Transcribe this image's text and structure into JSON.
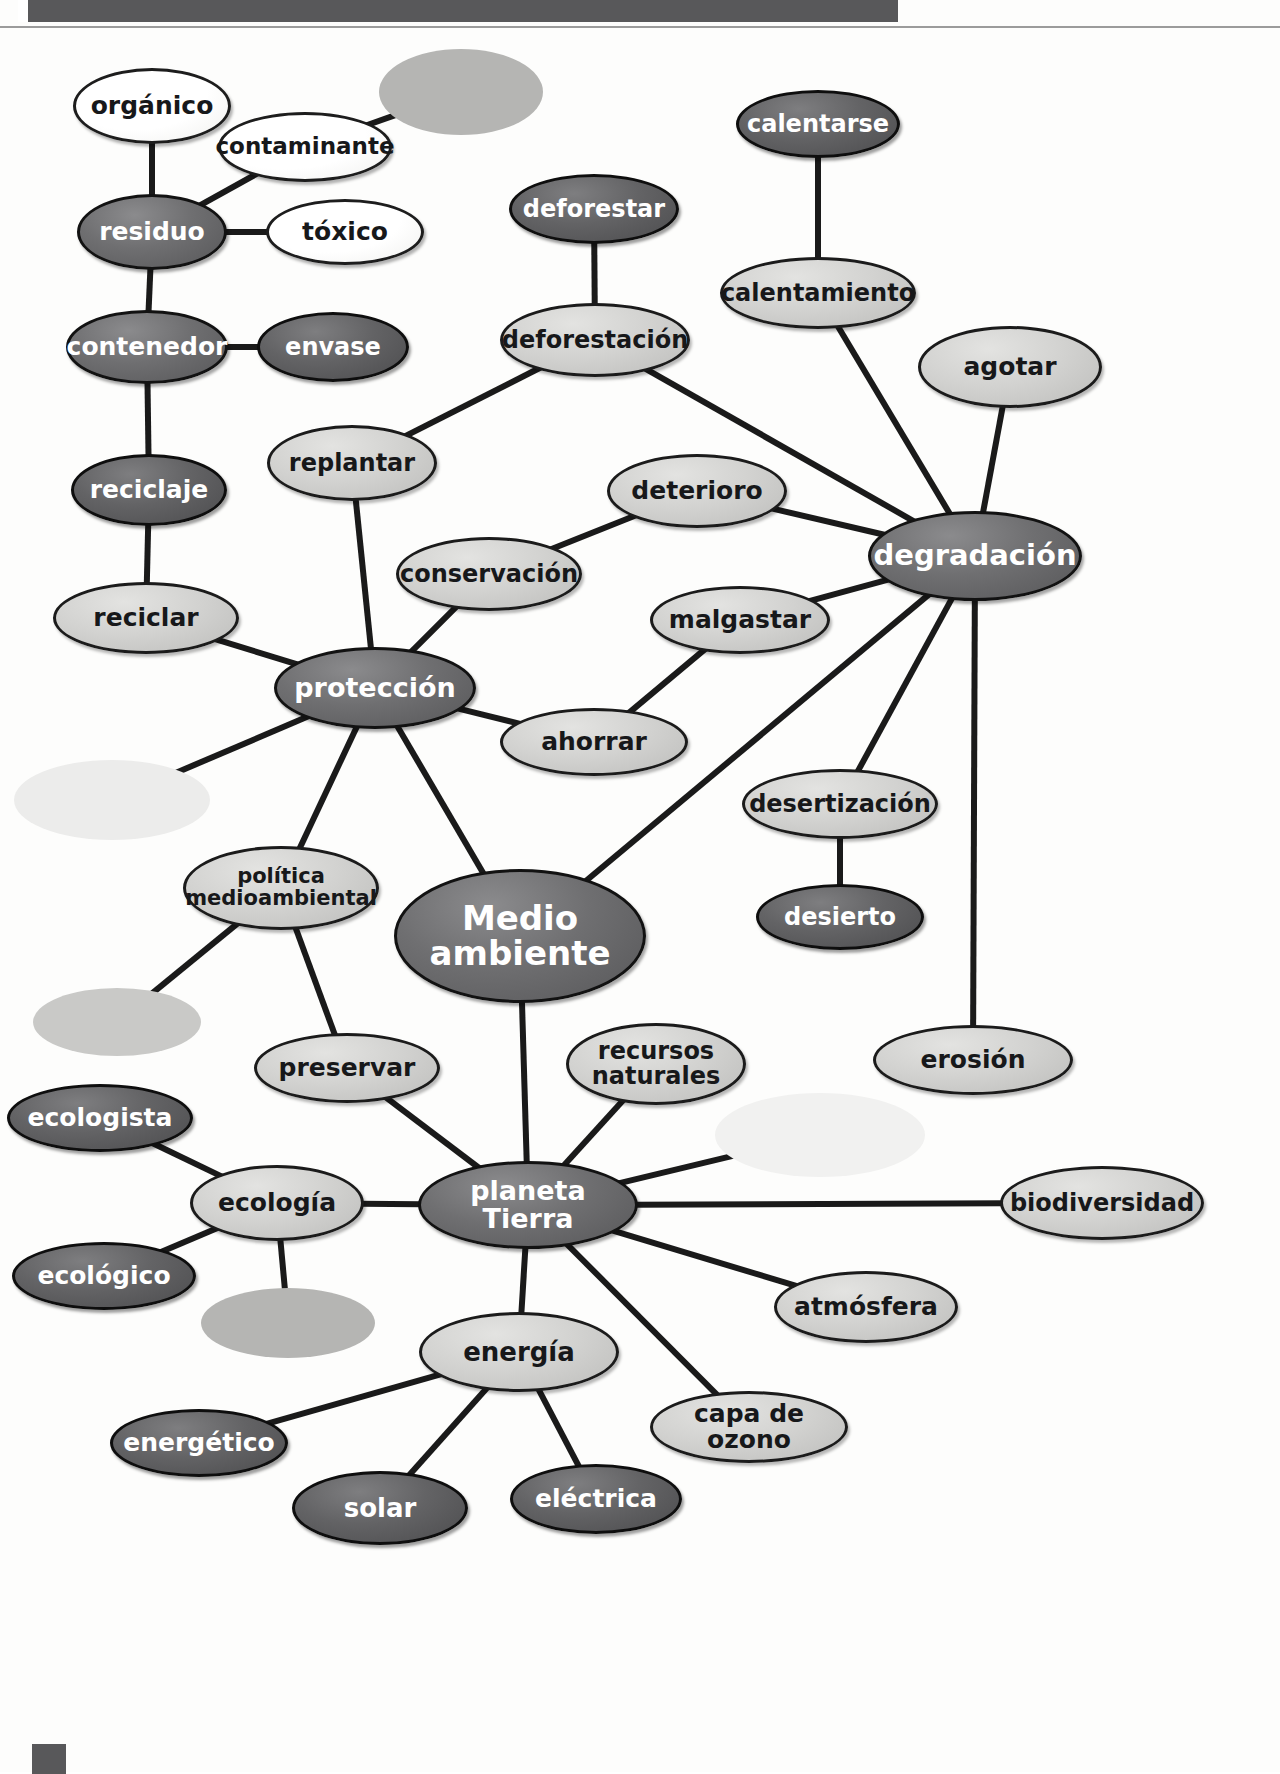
{
  "page": {
    "title": "Medio ambiente",
    "language": "es",
    "header_bar_color": "#58585a",
    "background_color": "#fdfdfc"
  },
  "chart_data": {
    "type": "diagram",
    "subtype": "mind-map",
    "title": "Medio ambiente",
    "center": "Medio ambiente",
    "nodes": [
      {
        "id": "organico",
        "label": "orgánico",
        "tone": "white",
        "cx": 152,
        "cy": 106,
        "rx": 79,
        "ry": 38,
        "font": 25
      },
      {
        "id": "contaminante",
        "label": "contaminante",
        "tone": "white",
        "cx": 305,
        "cy": 147,
        "rx": 87,
        "ry": 35,
        "font": 23
      },
      {
        "id": "blank-top",
        "label": "",
        "tone": "blank-mid",
        "cx": 461,
        "cy": 92,
        "rx": 82,
        "ry": 43,
        "font": 20
      },
      {
        "id": "residuo",
        "label": "residuo",
        "tone": "dark",
        "cx": 152,
        "cy": 232,
        "rx": 75,
        "ry": 38,
        "font": 25
      },
      {
        "id": "toxico",
        "label": "tóxico",
        "tone": "white",
        "cx": 345,
        "cy": 232,
        "rx": 79,
        "ry": 33,
        "font": 25
      },
      {
        "id": "contenedor",
        "label": "contenedor",
        "tone": "dark",
        "cx": 147,
        "cy": 347,
        "rx": 81,
        "ry": 37,
        "font": 25
      },
      {
        "id": "envase",
        "label": "envase",
        "tone": "darker",
        "cx": 333,
        "cy": 347,
        "rx": 76,
        "ry": 35,
        "font": 24
      },
      {
        "id": "reciclaje",
        "label": "reciclaje",
        "tone": "darker",
        "cx": 149,
        "cy": 490,
        "rx": 78,
        "ry": 36,
        "font": 25
      },
      {
        "id": "reciclar",
        "label": "reciclar",
        "tone": "light",
        "cx": 146,
        "cy": 618,
        "rx": 93,
        "ry": 36,
        "font": 25
      },
      {
        "id": "deforestar",
        "label": "deforestar",
        "tone": "darker",
        "cx": 594,
        "cy": 209,
        "rx": 85,
        "ry": 35,
        "font": 24
      },
      {
        "id": "deforestacion",
        "label": "deforestación",
        "tone": "light",
        "cx": 595,
        "cy": 340,
        "rx": 95,
        "ry": 37,
        "font": 24
      },
      {
        "id": "calentarse",
        "label": "calentarse",
        "tone": "darker",
        "cx": 818,
        "cy": 124,
        "rx": 82,
        "ry": 34,
        "font": 24
      },
      {
        "id": "calentamiento",
        "label": "calentamiento",
        "tone": "light",
        "cx": 818,
        "cy": 293,
        "rx": 98,
        "ry": 36,
        "font": 24
      },
      {
        "id": "agotar",
        "label": "agotar",
        "tone": "light",
        "cx": 1010,
        "cy": 367,
        "rx": 92,
        "ry": 41,
        "font": 25
      },
      {
        "id": "replantar",
        "label": "replantar",
        "tone": "light",
        "cx": 352,
        "cy": 463,
        "rx": 85,
        "ry": 38,
        "font": 24
      },
      {
        "id": "deterioro",
        "label": "deterioro",
        "tone": "light",
        "cx": 697,
        "cy": 491,
        "rx": 90,
        "ry": 37,
        "font": 25
      },
      {
        "id": "conservacion",
        "label": "conservación",
        "tone": "light",
        "cx": 489,
        "cy": 574,
        "rx": 93,
        "ry": 37,
        "font": 24
      },
      {
        "id": "degradacion",
        "label": "degradación",
        "tone": "dark",
        "cx": 975,
        "cy": 556,
        "rx": 107,
        "ry": 45,
        "font": 29
      },
      {
        "id": "malgastar",
        "label": "malgastar",
        "tone": "light",
        "cx": 740,
        "cy": 620,
        "rx": 90,
        "ry": 34,
        "font": 25
      },
      {
        "id": "proteccion",
        "label": "protección",
        "tone": "dark",
        "cx": 375,
        "cy": 688,
        "rx": 101,
        "ry": 41,
        "font": 27
      },
      {
        "id": "ahorrar",
        "label": "ahorrar",
        "tone": "light",
        "cx": 594,
        "cy": 742,
        "rx": 94,
        "ry": 34,
        "font": 25
      },
      {
        "id": "blank-left1",
        "label": "",
        "tone": "blank-pale",
        "cx": 112,
        "cy": 800,
        "rx": 98,
        "ry": 40,
        "font": 20
      },
      {
        "id": "desertizacion",
        "label": "desertización",
        "tone": "light",
        "cx": 840,
        "cy": 804,
        "rx": 98,
        "ry": 35,
        "font": 24
      },
      {
        "id": "desierto",
        "label": "desierto",
        "tone": "darker",
        "cx": 840,
        "cy": 917,
        "rx": 84,
        "ry": 33,
        "font": 24
      },
      {
        "id": "politica",
        "label": "política medioambiental",
        "tone": "light",
        "cx": 281,
        "cy": 888,
        "rx": 98,
        "ry": 42,
        "font": 21
      },
      {
        "id": "medio-ambiente",
        "label": "Medio ambiente",
        "tone": "dark",
        "cx": 520,
        "cy": 936,
        "rx": 126,
        "ry": 67,
        "font": 34
      },
      {
        "id": "blank-left2",
        "label": "",
        "tone": "blank-light",
        "cx": 117,
        "cy": 1022,
        "rx": 84,
        "ry": 34,
        "font": 20
      },
      {
        "id": "preservar",
        "label": "preservar",
        "tone": "light",
        "cx": 347,
        "cy": 1068,
        "rx": 93,
        "ry": 35,
        "font": 25
      },
      {
        "id": "recursos",
        "label": "recursos naturales",
        "tone": "light",
        "cx": 656,
        "cy": 1064,
        "rx": 90,
        "ry": 41,
        "font": 24
      },
      {
        "id": "erosion",
        "label": "erosión",
        "tone": "light",
        "cx": 973,
        "cy": 1060,
        "rx": 100,
        "ry": 35,
        "font": 25
      },
      {
        "id": "ecologista",
        "label": "ecologista",
        "tone": "darker",
        "cx": 100,
        "cy": 1118,
        "rx": 93,
        "ry": 34,
        "font": 25
      },
      {
        "id": "blank-right",
        "label": "",
        "tone": "blank-paler",
        "cx": 820,
        "cy": 1135,
        "rx": 105,
        "ry": 42,
        "font": 20
      },
      {
        "id": "ecologia",
        "label": "ecología",
        "tone": "light",
        "cx": 277,
        "cy": 1203,
        "rx": 87,
        "ry": 38,
        "font": 25
      },
      {
        "id": "planeta-tierra",
        "label": "planeta Tierra",
        "tone": "dark",
        "cx": 528,
        "cy": 1205,
        "rx": 110,
        "ry": 44,
        "font": 27
      },
      {
        "id": "biodiversidad",
        "label": "biodiversidad",
        "tone": "light",
        "cx": 1102,
        "cy": 1203,
        "rx": 102,
        "ry": 37,
        "font": 24
      },
      {
        "id": "ecologico",
        "label": "ecológico",
        "tone": "darker",
        "cx": 104,
        "cy": 1276,
        "rx": 92,
        "ry": 34,
        "font": 25
      },
      {
        "id": "blank-eco",
        "label": "",
        "tone": "blank-mid",
        "cx": 288,
        "cy": 1323,
        "rx": 87,
        "ry": 35,
        "font": 20
      },
      {
        "id": "atmosfera",
        "label": "atmósfera",
        "tone": "light",
        "cx": 866,
        "cy": 1307,
        "rx": 92,
        "ry": 36,
        "font": 25
      },
      {
        "id": "energia",
        "label": "energía",
        "tone": "light",
        "cx": 519,
        "cy": 1352,
        "rx": 100,
        "ry": 40,
        "font": 26
      },
      {
        "id": "capa-ozono",
        "label": "capa de ozono",
        "tone": "light",
        "cx": 749,
        "cy": 1427,
        "rx": 99,
        "ry": 36,
        "font": 25
      },
      {
        "id": "energetico",
        "label": "energético",
        "tone": "darker",
        "cx": 199,
        "cy": 1443,
        "rx": 89,
        "ry": 34,
        "font": 25
      },
      {
        "id": "solar",
        "label": "solar",
        "tone": "darker",
        "cx": 380,
        "cy": 1508,
        "rx": 88,
        "ry": 37,
        "font": 26
      },
      {
        "id": "electrica",
        "label": "eléctrica",
        "tone": "darker",
        "cx": 596,
        "cy": 1499,
        "rx": 86,
        "ry": 35,
        "font": 25
      }
    ],
    "edges": [
      [
        "organico",
        "residuo"
      ],
      [
        "contaminante",
        "residuo"
      ],
      [
        "contaminante",
        "blank-top"
      ],
      [
        "residuo",
        "toxico"
      ],
      [
        "residuo",
        "contenedor"
      ],
      [
        "contenedor",
        "envase"
      ],
      [
        "contenedor",
        "reciclaje"
      ],
      [
        "reciclaje",
        "reciclar"
      ],
      [
        "reciclar",
        "proteccion"
      ],
      [
        "deforestar",
        "deforestacion"
      ],
      [
        "deforestacion",
        "replantar"
      ],
      [
        "deforestacion",
        "degradacion"
      ],
      [
        "calentarse",
        "calentamiento"
      ],
      [
        "calentamiento",
        "degradacion"
      ],
      [
        "agotar",
        "degradacion"
      ],
      [
        "replantar",
        "proteccion"
      ],
      [
        "deterioro",
        "conservacion"
      ],
      [
        "deterioro",
        "degradacion"
      ],
      [
        "conservacion",
        "proteccion"
      ],
      [
        "malgastar",
        "degradacion"
      ],
      [
        "malgastar",
        "ahorrar"
      ],
      [
        "ahorrar",
        "proteccion"
      ],
      [
        "degradacion",
        "desertizacion"
      ],
      [
        "degradacion",
        "erosion"
      ],
      [
        "degradacion",
        "medio-ambiente"
      ],
      [
        "desertizacion",
        "desierto"
      ],
      [
        "proteccion",
        "blank-left1"
      ],
      [
        "proteccion",
        "politica"
      ],
      [
        "proteccion",
        "medio-ambiente"
      ],
      [
        "politica",
        "blank-left2"
      ],
      [
        "politica",
        "preservar"
      ],
      [
        "medio-ambiente",
        "planeta-tierra"
      ],
      [
        "preservar",
        "planeta-tierra"
      ],
      [
        "ecologista",
        "ecologia"
      ],
      [
        "ecologico",
        "ecologia"
      ],
      [
        "ecologia",
        "blank-eco"
      ],
      [
        "ecologia",
        "planeta-tierra"
      ],
      [
        "planeta-tierra",
        "recursos"
      ],
      [
        "planeta-tierra",
        "blank-right"
      ],
      [
        "planeta-tierra",
        "biodiversidad"
      ],
      [
        "planeta-tierra",
        "atmosfera"
      ],
      [
        "planeta-tierra",
        "capa-ozono"
      ],
      [
        "planeta-tierra",
        "energia"
      ],
      [
        "energia",
        "energetico"
      ],
      [
        "energia",
        "solar"
      ],
      [
        "energia",
        "electrica"
      ]
    ]
  }
}
